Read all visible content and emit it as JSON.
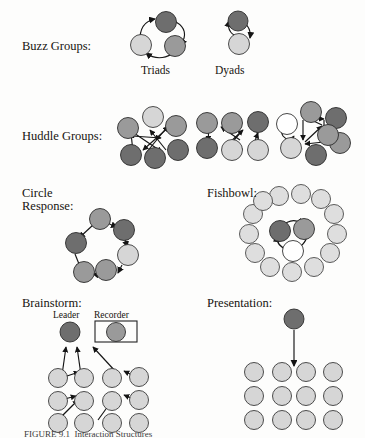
{
  "figure": {
    "caption": "FIGURE 9.1  Interaction Structures",
    "background_color": "#fdfdfc",
    "ink_color": "#17140f"
  },
  "palette": {
    "dark_gray": "#6e6e6e",
    "medium_gray": "#9a9a9a",
    "light_gray": "#d6d6d6",
    "very_light_gray": "#dedede",
    "white": "#ffffff",
    "outline": "#2c2c2c",
    "arrow": "#141414"
  },
  "rows": [
    {
      "id": "buzz-groups",
      "label": "Buzz Groups:",
      "label_x": 22,
      "label_y": 40,
      "diagrams": [
        {
          "id": "triads",
          "caption": "Triads",
          "caption_x": 141,
          "caption_y": 68,
          "node_count": 3,
          "arrangement": "triangle-cycle",
          "node_shades": [
            "dark_gray",
            "light_gray",
            "medium_gray"
          ],
          "arrows": 3,
          "arrow_style": "curved-cycle"
        },
        {
          "id": "dyads",
          "caption": "Dyads",
          "caption_x": 215,
          "caption_y": 68,
          "node_count": 2,
          "arrangement": "vertical-pair",
          "node_shades": [
            "dark_gray",
            "light_gray"
          ],
          "arrows": 2,
          "arrow_style": "curved-bidirectional"
        }
      ]
    },
    {
      "id": "huddle-groups",
      "label": "Huddle Groups:",
      "label_x": 22,
      "label_y": 130,
      "diagrams": [
        {
          "id": "huddle-1",
          "node_count": 6,
          "arrangement": "hexagon-ring",
          "node_shades": [
            "light_gray",
            "medium_gray",
            "medium_gray",
            "dark_gray",
            "dark_gray",
            "dark_gray"
          ],
          "arrows": 6,
          "arrow_style": "crossing-straight"
        },
        {
          "id": "huddle-2",
          "node_count": 6,
          "arrangement": "grid-2x3",
          "node_shades": [
            "medium_gray",
            "medium_gray",
            "dark_gray",
            "dark_gray",
            "light_gray",
            "light_gray"
          ],
          "arrows": 7,
          "arrow_style": "crossing-straight"
        },
        {
          "id": "huddle-3",
          "node_count": 7,
          "arrangement": "hexagon-ring-with-white",
          "node_shades": [
            "medium_gray",
            "dark_gray",
            "medium_gray",
            "dark_gray",
            "light_gray",
            "white",
            "medium_gray"
          ],
          "arrows": 8,
          "arrow_style": "ring-plus-self-loop"
        }
      ]
    },
    {
      "id": "circle-response",
      "label": "Circle\nResponse:",
      "label_x": 22,
      "label_y": 190,
      "diagrams": [
        {
          "id": "circle-response-ring",
          "node_count": 6,
          "arrangement": "circular-ring",
          "node_shades": [
            "medium_gray",
            "dark_gray",
            "light_gray",
            "medium_gray",
            "dark_gray",
            "medium_gray"
          ],
          "arrows": 6,
          "arrow_style": "sequential-around-ring"
        }
      ]
    },
    {
      "id": "fishbowl",
      "label": "Fishbowl:",
      "label_x": 207,
      "label_y": 190,
      "diagrams": [
        {
          "id": "fishbowl-structure",
          "outer_ring_count": 13,
          "outer_ring_shade": "very_light_gray",
          "inner_count": 3,
          "inner_shades": [
            "dark_gray",
            "medium_gray",
            "white"
          ],
          "arrows": 3,
          "arrow_style": "inner-triangle-cycle"
        }
      ]
    },
    {
      "id": "brainstorm",
      "label": "Brainstorm:",
      "label_x": 22,
      "label_y": 300,
      "diagrams": [
        {
          "id": "brainstorm-structure",
          "roles": [
            {
              "name": "Leader",
              "label_x": 57,
              "label_y": 313,
              "shade": "dark_gray",
              "boxed": false
            },
            {
              "name": "Recorder",
              "label_x": 97,
              "label_y": 313,
              "shade": "medium_gray",
              "boxed": true
            }
          ],
          "participant_grid": {
            "rows": 3,
            "cols": 4,
            "shade": "light_gray"
          },
          "arrows": 8,
          "arrow_style": "participants-to-leader-and-recorder"
        }
      ]
    },
    {
      "id": "presentation",
      "label": "Presentation:",
      "label_x": 207,
      "label_y": 300,
      "diagrams": [
        {
          "id": "presentation-structure",
          "presenter_shade": "dark_gray",
          "audience_grid": {
            "rows": 3,
            "cols": 4,
            "shade": "light_gray"
          },
          "arrows": 1,
          "arrow_style": "presenter-down-to-audience"
        }
      ]
    }
  ]
}
